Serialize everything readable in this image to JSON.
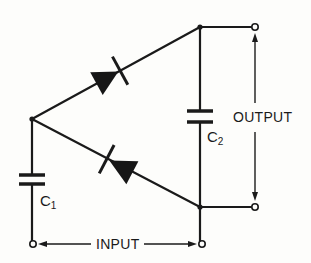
{
  "diagram": {
    "type": "voltage-doubler circuit schematic",
    "labels": {
      "input": "INPUT",
      "output": "OUTPUT",
      "c1_letter": "C",
      "c1_sub": "1",
      "c2_letter": "C",
      "c2_sub": "2"
    },
    "components": [
      {
        "id": "C1",
        "kind": "capacitor"
      },
      {
        "id": "C2",
        "kind": "capacitor"
      },
      {
        "id": "D1",
        "kind": "diode",
        "position": "upper"
      },
      {
        "id": "D2",
        "kind": "diode",
        "position": "lower"
      }
    ],
    "colors": {
      "ink": "#1a1a1a",
      "paper": "#fdfdfb"
    }
  }
}
